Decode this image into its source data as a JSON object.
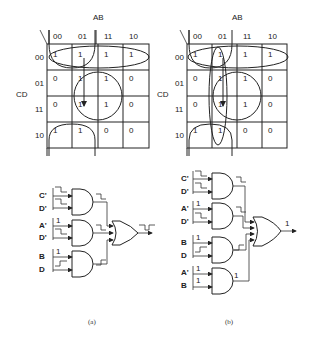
{
  "figure": {
    "panels": [
      {
        "id": "a",
        "caption": "(a)",
        "kmap": {
          "col_var": "AB",
          "row_var": "CD",
          "col_labels": [
            "00",
            "01",
            "11",
            "10"
          ],
          "row_labels": [
            "00",
            "01",
            "11",
            "10"
          ],
          "cells": [
            [
              "1",
              "1",
              "1",
              "1"
            ],
            [
              "0",
              "1",
              "1",
              "0"
            ],
            [
              "0",
              "1",
              "1",
              "0"
            ],
            [
              "1",
              "1",
              "0",
              "0"
            ]
          ],
          "groups": [
            "C'D' (row 00)",
            "BD (center circle)",
            "A'D' (corners/wrap)"
          ],
          "transition_arrow": "from 0100 (row 00, col 01) to 0111 (row 11, col 01)"
        },
        "gates": [
          {
            "inputs": [
              "C'",
              "D'"
            ],
            "input_signals": [
              "step-down",
              "step-down"
            ],
            "output_signal": "step-down"
          },
          {
            "inputs": [
              "A'",
              "D'"
            ],
            "input_signals": [
              "1",
              "step-down"
            ],
            "output_signal": "step-down"
          },
          {
            "inputs": [
              "B",
              "D"
            ],
            "input_signals": [
              "1",
              "step-up"
            ],
            "output_signal": "step-up"
          }
        ],
        "or_output_signal": "glitch (hazard)"
      },
      {
        "id": "b",
        "caption": "(b)",
        "kmap": {
          "col_var": "AB",
          "row_var": "CD",
          "col_labels": [
            "00",
            "01",
            "11",
            "10"
          ],
          "row_labels": [
            "00",
            "01",
            "11",
            "10"
          ],
          "cells": [
            [
              "1",
              "1",
              "1",
              "1"
            ],
            [
              "0",
              "1",
              "1",
              "0"
            ],
            [
              "0",
              "1",
              "1",
              "0"
            ],
            [
              "1",
              "1",
              "0",
              "0"
            ]
          ],
          "groups": [
            "C'D' (row 00)",
            "BD (center circle)",
            "A'D' (corners/wrap)",
            "A'B (column 01 ellipse)"
          ],
          "transition_arrow": "from 0100 (row 00, col 01) to 0111 (row 11, col 01)"
        },
        "gates": [
          {
            "inputs": [
              "C'",
              "D'"
            ],
            "input_signals": [
              "step-down",
              "step-down"
            ],
            "output_signal": "step-down"
          },
          {
            "inputs": [
              "A'",
              "D'"
            ],
            "input_signals": [
              "1",
              "step-down"
            ],
            "output_signal": "step-down"
          },
          {
            "inputs": [
              "B",
              "D"
            ],
            "input_signals": [
              "1",
              "step-up"
            ],
            "output_signal": "step-up"
          },
          {
            "inputs": [
              "A'",
              "B"
            ],
            "input_signals": [
              "1",
              "1"
            ],
            "output_signal": "1"
          }
        ],
        "or_output_signal": "1"
      }
    ],
    "labels": {
      "ab": "AB",
      "cd": "CD",
      "one": "1",
      "zero": "0",
      "cap_a": "(a)",
      "cap_b": "(b)",
      "c_prime": "C'",
      "d_prime": "D'",
      "a_prime": "A'",
      "b": "B",
      "d": "D"
    }
  }
}
